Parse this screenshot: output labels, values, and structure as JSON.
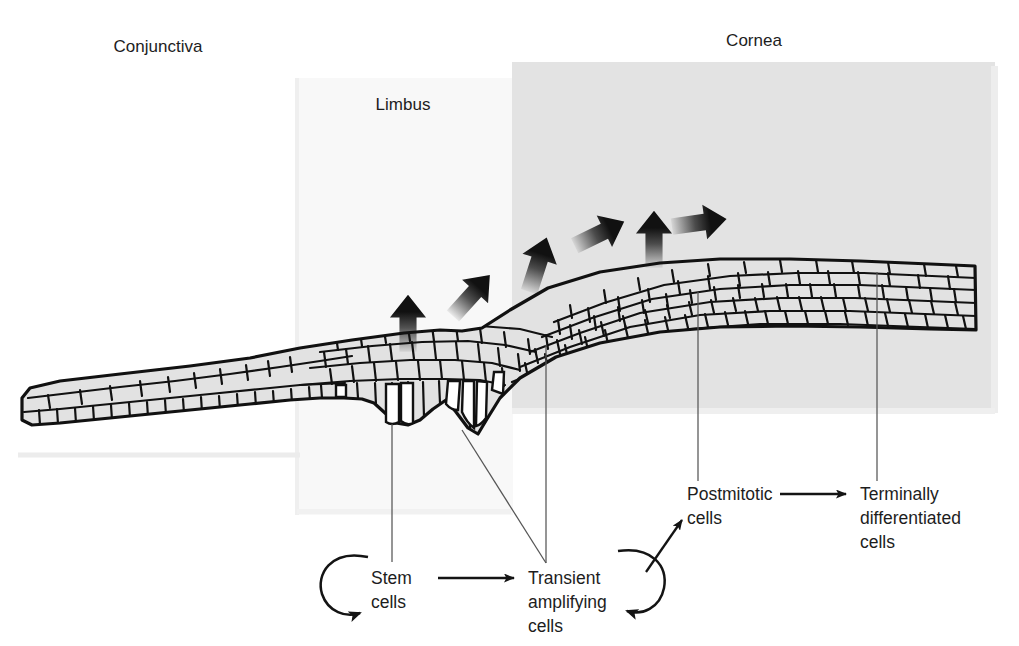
{
  "figure": {
    "background_color": "#ffffff",
    "ink_color": "#1d1d1d"
  },
  "panels": [
    {
      "id": "limbus-panel",
      "name": "Limbus shaded panel",
      "fill": "#f7f7f7",
      "x": 295,
      "y": 78,
      "width": 218,
      "height": 437
    },
    {
      "id": "cornea-panel",
      "name": "Cornea shaded panel",
      "fill": "#e2e2e2",
      "x": 512,
      "y": 62,
      "width": 483,
      "height": 351
    }
  ],
  "region_labels": [
    {
      "id": "conjunctiva",
      "text": "Conjunctiva",
      "x": 158,
      "y": 52
    },
    {
      "id": "limbus",
      "text": "Limbus",
      "x": 403,
      "y": 110
    },
    {
      "id": "cornea",
      "text": "Cornea",
      "x": 754,
      "y": 46
    }
  ],
  "cell_labels": [
    {
      "id": "stem-cells",
      "lines": [
        "Stem",
        "cells"
      ],
      "x": 372,
      "y": 579,
      "leader": {
        "from_x": 392,
        "from_y": 424,
        "to_x": 392,
        "to_y": 562
      },
      "self_renewal": true
    },
    {
      "id": "transient-amplifying-cells",
      "lines": [
        "Transient",
        "amplifying",
        "cells"
      ],
      "x": 530,
      "y": 579,
      "leaders": [
        {
          "from_x": 462,
          "from_y": 430,
          "to_x": 546,
          "to_y": 562
        },
        {
          "from_x": 546,
          "from_y": 345,
          "to_x": 546,
          "to_y": 562
        }
      ],
      "self_renewal": true
    },
    {
      "id": "postmitotic-cells",
      "lines": [
        "Postmitotic",
        "cells"
      ],
      "x": 688,
      "y": 499,
      "leader": {
        "from_x": 698,
        "from_y": 290,
        "to_x": 698,
        "to_y": 482
      }
    },
    {
      "id": "terminally-differentiated-cells",
      "lines": [
        "Terminally",
        "differentiated",
        "cells"
      ],
      "x": 862,
      "y": 499,
      "leader": {
        "from_x": 877,
        "from_y": 272,
        "to_x": 877,
        "to_y": 482
      }
    }
  ],
  "flow_arrows": [
    {
      "id": "stem-to-transient",
      "from": "stem-cells",
      "to": "transient-amplifying-cells"
    },
    {
      "id": "transient-to-postmitotic",
      "from": "transient-amplifying-cells",
      "to": "postmitotic-cells"
    },
    {
      "id": "postmitotic-to-terminal",
      "from": "postmitotic-cells",
      "to": "terminally-differentiated-cells"
    }
  ],
  "migration_arrows": [
    {
      "id": "migration-arrow-1",
      "direction": "up",
      "x": 408,
      "y": 312,
      "angle": 0
    },
    {
      "id": "migration-arrow-2",
      "direction": "up-right",
      "x": 478,
      "y": 288,
      "angle": 40
    },
    {
      "id": "migration-arrow-3",
      "direction": "up-right",
      "x": 541,
      "y": 252,
      "angle": 20
    },
    {
      "id": "migration-arrow-4",
      "direction": "up-right",
      "x": 609,
      "y": 229,
      "angle": 62
    },
    {
      "id": "migration-arrow-5",
      "direction": "up",
      "x": 654,
      "y": 227,
      "angle": 0
    },
    {
      "id": "migration-arrow-6",
      "direction": "right",
      "x": 710,
      "y": 222,
      "angle": 80
    }
  ],
  "epithelium": {
    "name": "Ocular surface epithelium",
    "description": "Stratified squamous epithelium thin over conjunctiva, thickened with crypts at the limbus, and multilayered over the cornea",
    "cell_fill": "#e0e0e0",
    "stem_cell_fill": "#ffffff",
    "outline_color": "#111111"
  }
}
